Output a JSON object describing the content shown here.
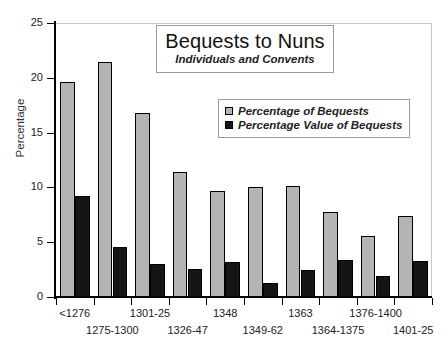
{
  "chart_data": {
    "type": "bar",
    "title": "Bequests to Nuns",
    "subtitle": "Individuals and Convents",
    "xlabel": "",
    "ylabel": "Percentage",
    "ylim": [
      0,
      25
    ],
    "yticks": [
      0,
      5,
      10,
      15,
      20,
      25
    ],
    "ytick_labels": [
      "0",
      "5",
      "10",
      "15",
      "20",
      "25"
    ],
    "grid": false,
    "legend_position": "upper-center-right",
    "categories": [
      "<1276",
      "1275-1300",
      "1301-25",
      "1326-47",
      "1348",
      "1349-62",
      "1363",
      "1364-1375",
      "1376-1400",
      "1401-25"
    ],
    "series": [
      {
        "name": "Percentage of Bequests",
        "color": "#b4b4b4",
        "values": [
          19.6,
          21.4,
          16.8,
          11.4,
          9.7,
          10.0,
          10.1,
          7.8,
          5.6,
          7.4
        ]
      },
      {
        "name": "Percentage Value of Bequests",
        "color": "#151515",
        "values": [
          9.2,
          4.6,
          3.0,
          2.6,
          3.2,
          1.3,
          2.5,
          3.4,
          1.9,
          3.3
        ]
      }
    ]
  },
  "axis": {
    "y_title": "Percentage"
  },
  "legend": {
    "entries": [
      {
        "label": "Percentage of Bequests",
        "swatch": "gray"
      },
      {
        "label": "Percentage Value of Bequests",
        "swatch": "black"
      }
    ]
  }
}
